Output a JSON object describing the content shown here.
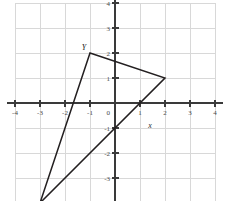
{
  "figure": {
    "background_color": "#ffffff",
    "grid_color": "#d8d8d8",
    "axis_color": "#3a3a3a",
    "shape_color": "#231f20"
  },
  "axes": {
    "x_label": "x",
    "y_label": "",
    "origin_label": "0",
    "x_tick_labels": [
      "-4",
      "-3",
      "-2",
      "-1",
      "0",
      "1",
      "2",
      "3",
      "4"
    ],
    "y_tick_labels": [
      "4",
      "3",
      "2",
      "1",
      "0",
      "-1",
      "-2",
      "-3",
      "-4"
    ]
  },
  "chart_data": {
    "type": "scatter",
    "title": "",
    "xlabel": "x",
    "ylabel": "",
    "xlim": [
      -4,
      4
    ],
    "ylim": [
      -4,
      4
    ],
    "grid": true,
    "legend": "none",
    "x_ticks": [
      -4,
      -3,
      -2,
      -1,
      0,
      1,
      2,
      3,
      4
    ],
    "y_ticks": [
      -4,
      -3,
      -2,
      -1,
      0,
      1,
      2,
      3,
      4
    ],
    "annotations": [
      {
        "text": "Y",
        "x": -1,
        "y": 2
      },
      {
        "text": "x",
        "x": 1.4,
        "y": -1.0
      }
    ],
    "series": [
      {
        "name": "triangle",
        "closed": true,
        "points": [
          {
            "x": -1,
            "y": 2
          },
          {
            "x": 2,
            "y": 1
          },
          {
            "x": -3,
            "y": -4
          }
        ]
      }
    ]
  }
}
